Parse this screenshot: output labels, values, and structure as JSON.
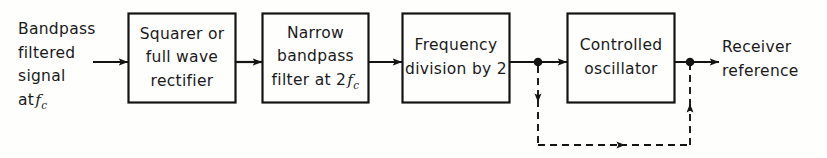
{
  "diagram": {
    "colors": {
      "line": "#141414",
      "background": "#fefefd",
      "text": "#1a1a1a"
    },
    "input_label": {
      "lines": [
        "Bandpass",
        "filtered",
        "signal",
        "at"
      ],
      "symbol_italic": "f",
      "symbol_sub": "c"
    },
    "output_label": {
      "lines": [
        "Receiver",
        "reference"
      ]
    },
    "blocks": [
      {
        "id": "squarer-rectifier",
        "lines": [
          "Squarer or",
          "full  wave",
          "rectifier"
        ]
      },
      {
        "id": "narrow-bandpass-filter",
        "lines": [
          "Narrow",
          "bandpass"
        ],
        "last_line_prefix": "filter at 2",
        "last_line_italic": "f",
        "last_line_sub": "c"
      },
      {
        "id": "frequency-division",
        "lines": [
          "Frequency",
          "division by 2"
        ]
      },
      {
        "id": "controlled-oscillator",
        "lines": [
          "Controlled",
          "oscillator"
        ]
      }
    ],
    "connections": {
      "input_arrow": "solid-arrow-right",
      "between_1_2": "solid-arrow-right",
      "between_2_3": "solid-arrow-right",
      "between_3_4": "solid-arrow-right-with-junction",
      "output_arrow": "solid-arrow-right-with-junction",
      "feedback": "dashed-loop-from-divider-to-oscillator"
    }
  }
}
